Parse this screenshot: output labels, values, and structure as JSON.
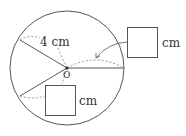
{
  "diagram": {
    "center_label": "O",
    "radius_label": "4 cm",
    "answer_boxes": [
      {
        "unit": "cm"
      },
      {
        "unit": "cm"
      }
    ],
    "colors": {
      "stroke": "#555555",
      "dashed": "#777777"
    }
  }
}
